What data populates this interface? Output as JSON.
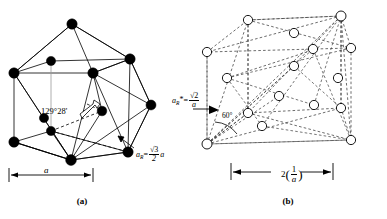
{
  "figure": {
    "title_mark": "",
    "panels": [
      {
        "id": "a",
        "caption": "(a)",
        "kind": "real-space-fcc-rhombohedral-cell",
        "atom_style": "filled-black-circle",
        "atom_count": 14,
        "labels": {
          "angle": "129°28'",
          "edge_symbol": "a",
          "rhombohedral_axis_prefix": "a",
          "rhombohedral_axis_sub": "R",
          "rhombohedral_axis_eq": "=",
          "rhombohedral_axis_num": "√3",
          "rhombohedral_axis_den": "2",
          "rhombohedral_axis_tail": "a",
          "dimension_label": "a"
        }
      },
      {
        "id": "b",
        "caption": "(b)",
        "kind": "reciprocal-space-bcc-rhombohedral-cell",
        "atom_style": "open-white-circle",
        "atom_count": 14,
        "labels": {
          "angle": "60°",
          "recip_axis_prefix": "a",
          "recip_axis_sub": "R",
          "recip_axis_star": "*",
          "recip_axis_eq": "=",
          "recip_axis_num": "√2",
          "recip_axis_den": "a",
          "dimension_prefix": "2",
          "dimension_num": "1",
          "dimension_den": "a"
        }
      }
    ],
    "colors": {
      "ink": "#000000",
      "background": "#ffffff",
      "dashed_ink": "#555555",
      "node_fill_a": "#000000",
      "node_fill_b": "#ffffff"
    }
  }
}
